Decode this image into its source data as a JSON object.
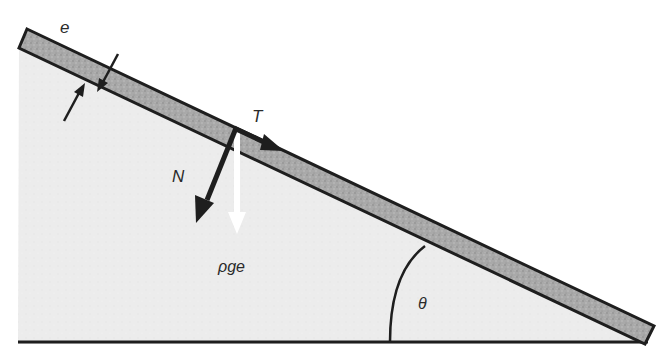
{
  "figure": {
    "labels": {
      "thickness": "e",
      "tangential_force": "T",
      "normal_force": "N",
      "weight": "ρge",
      "angle": "θ"
    },
    "colors": {
      "background": "#ffffff",
      "ground_fill": "#ececec",
      "slab_fill": "#a8a8a8",
      "outline": "#1e1e1e",
      "weight_arrow": "#ffffff"
    }
  }
}
